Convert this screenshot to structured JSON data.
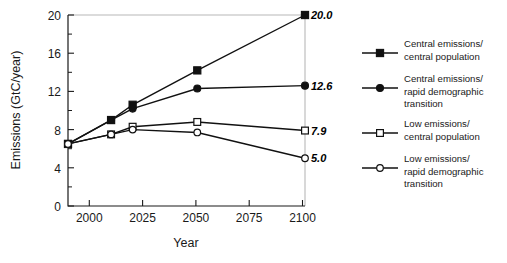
{
  "chart_data": {
    "type": "line",
    "title": "",
    "xlabel": "Year",
    "ylabel": "Emissions (GtC/year)",
    "xlim": [
      1990,
      2100
    ],
    "ylim": [
      0,
      20
    ],
    "xticks": [
      2000,
      2025,
      2050,
      2075,
      2100
    ],
    "xtick_labels": [
      "2000",
      "2025",
      "2050",
      "2075",
      "2100"
    ],
    "yticks": [
      0,
      4,
      8,
      12,
      16,
      20
    ],
    "ytick_labels": [
      "0",
      "4",
      "8",
      "12",
      "16",
      "20"
    ],
    "y_minor_ticks": [
      2,
      6,
      10,
      14,
      18
    ],
    "grid": false,
    "legend_position": "right",
    "x": [
      1990,
      2010,
      2020,
      2050,
      2100
    ],
    "series": [
      {
        "name": "Central emissions/ central population",
        "legend_line1": "Central emissions/",
        "legend_line2": "central population",
        "legend_line3": "",
        "marker": "filled-square",
        "values": [
          6.5,
          9.0,
          10.6,
          14.2,
          20.0
        ],
        "end_label": "20.0"
      },
      {
        "name": "Central emissions/ rapid demographic transition",
        "legend_line1": "Central emissions/",
        "legend_line2": "rapid demographic",
        "legend_line3": "transition",
        "marker": "filled-circle",
        "values": [
          6.5,
          9.0,
          10.2,
          12.3,
          12.6
        ],
        "end_label": "12.6"
      },
      {
        "name": "Low emissions/ central population",
        "legend_line1": "Low emissions/",
        "legend_line2": "central population",
        "legend_line3": "",
        "marker": "open-square",
        "values": [
          6.5,
          7.5,
          8.3,
          8.8,
          7.9
        ],
        "end_label": "7.9"
      },
      {
        "name": "Low emissions/ rapid demographic transition",
        "legend_line1": "Low emissions/",
        "legend_line2": "rapid demographic",
        "legend_line3": "transition",
        "marker": "open-circle",
        "values": [
          6.5,
          7.5,
          8.0,
          7.7,
          5.0
        ],
        "end_label": "5.0"
      }
    ],
    "colors": {
      "line": "#111111",
      "frame": "#b8b8b8",
      "axis": "#1a1a1a",
      "background": "#ffffff",
      "marker_fill_open": "#ffffff"
    }
  }
}
